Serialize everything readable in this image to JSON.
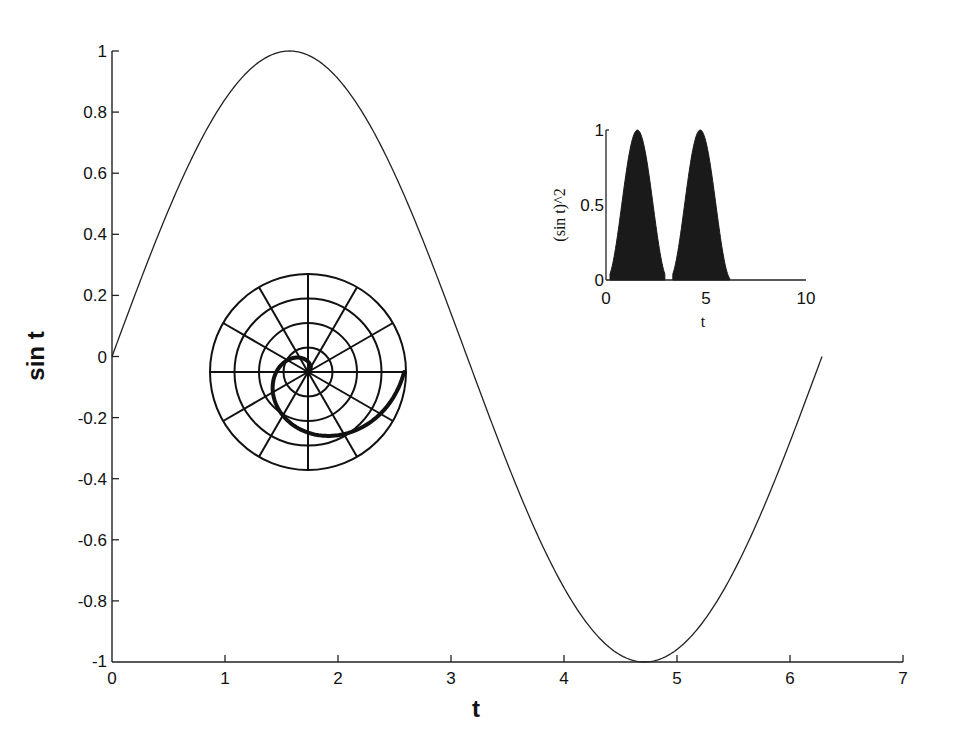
{
  "chart_data": [
    {
      "type": "line",
      "name": "main",
      "title": "",
      "xlabel": "t",
      "ylabel": "sin t",
      "xlim": [
        0,
        7
      ],
      "ylim": [
        -1,
        1
      ],
      "xticks": [
        "0",
        "1",
        "2",
        "3",
        "4",
        "5",
        "6",
        "7"
      ],
      "yticks": [
        "1",
        "0.8",
        "0.6",
        "0.4",
        "0.2",
        "0",
        "-0.2",
        "-0.4",
        "-0.6",
        "-0.8",
        "-1"
      ],
      "grid": false,
      "series": [
        {
          "name": "sin t",
          "function": "sin(t)",
          "t_range": [
            0,
            6.283
          ],
          "x": [
            0,
            0.785,
            1.571,
            2.356,
            3.142,
            3.927,
            4.712,
            5.498,
            6.283
          ],
          "values": [
            0,
            0.707,
            1,
            0.707,
            0,
            -0.707,
            -1,
            -0.707,
            0
          ]
        }
      ],
      "color": "#222222"
    },
    {
      "type": "area",
      "name": "inset",
      "title": "",
      "xlabel": "t",
      "ylabel": "(sin t)^2",
      "xlim": [
        0,
        10
      ],
      "ylim": [
        0,
        1
      ],
      "xticks": [
        "0",
        "5",
        "10"
      ],
      "yticks": [
        "0",
        "0.5",
        "1"
      ],
      "grid": false,
      "series": [
        {
          "name": "(sin t)^2",
          "function": "sin(t)^2",
          "t_range": [
            0,
            6.283
          ],
          "x": [
            0,
            0.785,
            1.571,
            2.356,
            3.142,
            3.927,
            4.712,
            5.498,
            6.283
          ],
          "values": [
            0,
            0.5,
            1,
            0.5,
            0,
            0.5,
            1,
            0.5,
            0
          ]
        }
      ],
      "fill": "#1a1a1a"
    },
    {
      "type": "polar",
      "name": "polar-spiral",
      "title": "",
      "rings": 4,
      "spokes": 12,
      "series": [
        {
          "name": "spiral",
          "description": "thick spiral r increasing with theta, from origin to outer rim at theta ~ 2pi"
        }
      ]
    }
  ]
}
